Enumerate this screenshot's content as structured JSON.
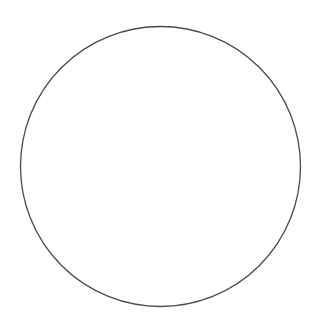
{
  "figure": {
    "type": "sector-circle-diagram",
    "canvas": {
      "width": 321,
      "height": 331,
      "background": "#ffffff"
    },
    "circle": {
      "name": "circle-outline",
      "center_x": 160.5,
      "center_y": 166.5,
      "radius": 140,
      "stroke": "#4a4a4a",
      "stroke_width": 1.3,
      "fill": "#ffffff"
    },
    "solid_spokes": {
      "stroke": "#4a4a4a",
      "count": 9,
      "items": [
        {
          "label": "spoke-up-vertical",
          "angle_deg": 90.0,
          "stroke_width": 1.4
        },
        {
          "label": "spoke-upper-left-steep",
          "angle_deg": 130.4,
          "stroke_width": 1.5
        },
        {
          "label": "spoke-left-horizontal",
          "angle_deg": 171.1,
          "stroke_width": 1.2
        },
        {
          "label": "spoke-lower-left-shallow",
          "angle_deg": 209.8,
          "stroke_width": 1.0
        },
        {
          "label": "spoke-lower-left-steep",
          "angle_deg": 250.5,
          "stroke_width": 1.5
        },
        {
          "label": "spoke-lower-right-steep",
          "angle_deg": 289.9,
          "stroke_width": 1.5
        },
        {
          "label": "spoke-lower-right-shallow",
          "angle_deg": 328.3,
          "stroke_width": 1.4
        },
        {
          "label": "spoke-right-horizontal",
          "angle_deg": 7.6,
          "stroke_width": 1.2
        },
        {
          "label": "spoke-upper-right-steep",
          "angle_deg": 49.9,
          "stroke_width": 1.1
        }
      ]
    },
    "dashed_bisectors": {
      "stroke": "#6b6b6b",
      "stroke_width": 1.3,
      "dash_pattern": "7 7",
      "inner_radius_fraction": 0.22,
      "outer_radius_fraction": 0.86,
      "count": 9,
      "items": [
        {
          "label": "bisector-n-ne",
          "angle_deg": 70.0
        },
        {
          "label": "bisector-ne-nw",
          "angle_deg": 110.2
        },
        {
          "label": "bisector-nw-w",
          "angle_deg": 150.8
        },
        {
          "label": "bisector-w-sw",
          "angle_deg": 190.5
        },
        {
          "label": "bisector-sw-s",
          "angle_deg": 230.2
        },
        {
          "label": "bisector-s-sse",
          "angle_deg": 270.2
        },
        {
          "label": "bisector-sse-se",
          "angle_deg": 309.1
        },
        {
          "label": "bisector-se-e",
          "angle_deg": 348.0
        },
        {
          "label": "bisector-e-ne",
          "angle_deg": 28.8
        }
      ]
    }
  }
}
